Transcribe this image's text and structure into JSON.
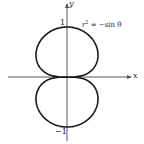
{
  "chart_data": {
    "type": "line",
    "title": "",
    "equation": "r² = −sin θ",
    "xlabel": "x",
    "ylabel": "y",
    "y_ticks": [
      {
        "value": 1,
        "label": "1"
      },
      {
        "value": -1,
        "label": "−1"
      }
    ],
    "xlim": [
      -1.2,
      1.3
    ],
    "ylim": [
      -1.25,
      1.5
    ],
    "grid": false,
    "series": [
      {
        "name": "r^2 = -sin(theta)",
        "kind": "polar",
        "description": "Vertical figure-eight (two lobes) touching origin, extending from y=-1 to y=1, max |x| approx 0.62"
      }
    ]
  },
  "labels": {
    "x_axis": "x",
    "y_axis": "y",
    "tick_top": "1",
    "tick_bottom": "−1",
    "equation_lhs": "r",
    "equation_sup": "2",
    "equation_rhs": " = −sin θ"
  },
  "colors": {
    "curve": "#1a1a1a",
    "axis": "#555555"
  }
}
